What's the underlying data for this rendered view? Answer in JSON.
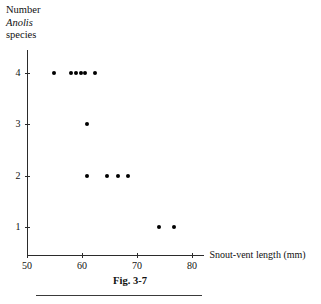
{
  "figure": {
    "caption": "Fig. 3-7"
  },
  "chart_data": {
    "type": "scatter",
    "title": "",
    "subtitle": "",
    "xlabel": "Snout-vent length (mm)",
    "ylabel_lines": [
      "Number",
      "Anolis",
      "species"
    ],
    "ylabel_italic_line": "Anolis",
    "xlim": [
      50,
      82
    ],
    "ylim": [
      0.45,
      4.45
    ],
    "xticks": [
      50,
      60,
      70,
      80
    ],
    "xtick_labels": [
      "50",
      "60",
      "70",
      "80"
    ],
    "yticks": [
      1,
      2,
      3,
      4
    ],
    "ytick_labels": [
      "1",
      "2",
      "3",
      "4"
    ],
    "grid": false,
    "legend": null,
    "marker": "filled-circle",
    "marker_color": "#000000",
    "axis_color": "#2b2b2b",
    "points": [
      {
        "x": 55.0,
        "y": 4
      },
      {
        "x": 58.0,
        "y": 4
      },
      {
        "x": 58.9,
        "y": 4
      },
      {
        "x": 59.8,
        "y": 4
      },
      {
        "x": 60.6,
        "y": 4
      },
      {
        "x": 62.3,
        "y": 4
      },
      {
        "x": 61.0,
        "y": 3
      },
      {
        "x": 61.0,
        "y": 2
      },
      {
        "x": 64.6,
        "y": 2
      },
      {
        "x": 66.6,
        "y": 2
      },
      {
        "x": 68.4,
        "y": 2
      },
      {
        "x": 74.0,
        "y": 1
      },
      {
        "x": 76.6,
        "y": 1
      }
    ]
  }
}
